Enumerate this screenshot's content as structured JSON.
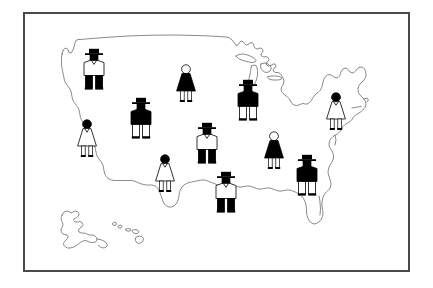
{
  "title": "United States map with population pictograms",
  "frame": {
    "border_color": "#4a4a4a",
    "background_color": "#ffffff"
  },
  "map": {
    "name": "united-states-outline",
    "outline_color": "#6b6b6b",
    "fill_color": "#ffffff",
    "regions": [
      "Contiguous United States",
      "Alaska",
      "Hawaii"
    ],
    "labels": []
  },
  "legend": {
    "visible": false,
    "items": []
  },
  "pictograms": {
    "count": 11,
    "colors": {
      "dark": "#000000",
      "light": "#ffffff",
      "outline": "#000000"
    },
    "figures": [
      {
        "id": "figure-pacific-northwest",
        "type": "man",
        "hat": true,
        "torso": "light",
        "legs": "dark",
        "head": "dark",
        "region": "Pacific Northwest",
        "x": 94,
        "y": 51,
        "scale": 1.0
      },
      {
        "id": "figure-upper-midwest",
        "type": "woman",
        "hat": false,
        "torso": "dark",
        "legs": "light",
        "head": "light",
        "region": "Upper Midwest",
        "x": 186,
        "y": 64,
        "scale": 1.0
      },
      {
        "id": "figure-great-lakes",
        "type": "man",
        "hat": true,
        "torso": "dark",
        "legs": "light",
        "head": "dark",
        "region": "Great Lakes",
        "x": 248,
        "y": 82,
        "scale": 1.0
      },
      {
        "id": "figure-northeast",
        "type": "woman",
        "hat": false,
        "torso": "light",
        "legs": "light",
        "head": "dark",
        "region": "Northeast",
        "x": 336,
        "y": 92,
        "scale": 1.0
      },
      {
        "id": "figure-mountain-west",
        "type": "man",
        "hat": true,
        "torso": "dark",
        "legs": "light",
        "head": "dark",
        "region": "Mountain West",
        "x": 141,
        "y": 100,
        "scale": 1.0
      },
      {
        "id": "figure-california",
        "type": "woman",
        "hat": false,
        "torso": "light",
        "legs": "light",
        "head": "dark",
        "region": "California",
        "x": 87,
        "y": 119,
        "scale": 1.0
      },
      {
        "id": "figure-great-plains",
        "type": "man",
        "hat": true,
        "torso": "light",
        "legs": "dark",
        "head": "dark",
        "region": "Great Plains",
        "x": 207,
        "y": 125,
        "scale": 1.0
      },
      {
        "id": "figure-mid-atlantic",
        "type": "woman",
        "hat": false,
        "torso": "dark",
        "legs": "light",
        "head": "light",
        "region": "Mid-Atlantic",
        "x": 274,
        "y": 131,
        "scale": 1.0
      },
      {
        "id": "figure-southwest",
        "type": "woman",
        "hat": false,
        "torso": "light",
        "legs": "light",
        "head": "dark",
        "region": "Southwest",
        "x": 165,
        "y": 154,
        "scale": 1.0
      },
      {
        "id": "figure-southeast",
        "type": "man",
        "hat": true,
        "torso": "dark",
        "legs": "light",
        "head": "dark",
        "region": "Southeast",
        "x": 307,
        "y": 157,
        "scale": 1.0
      },
      {
        "id": "figure-gulf-coast",
        "type": "man",
        "hat": true,
        "torso": "light",
        "legs": "dark",
        "head": "dark",
        "region": "Gulf Coast",
        "x": 226,
        "y": 174,
        "scale": 1.0
      }
    ]
  }
}
